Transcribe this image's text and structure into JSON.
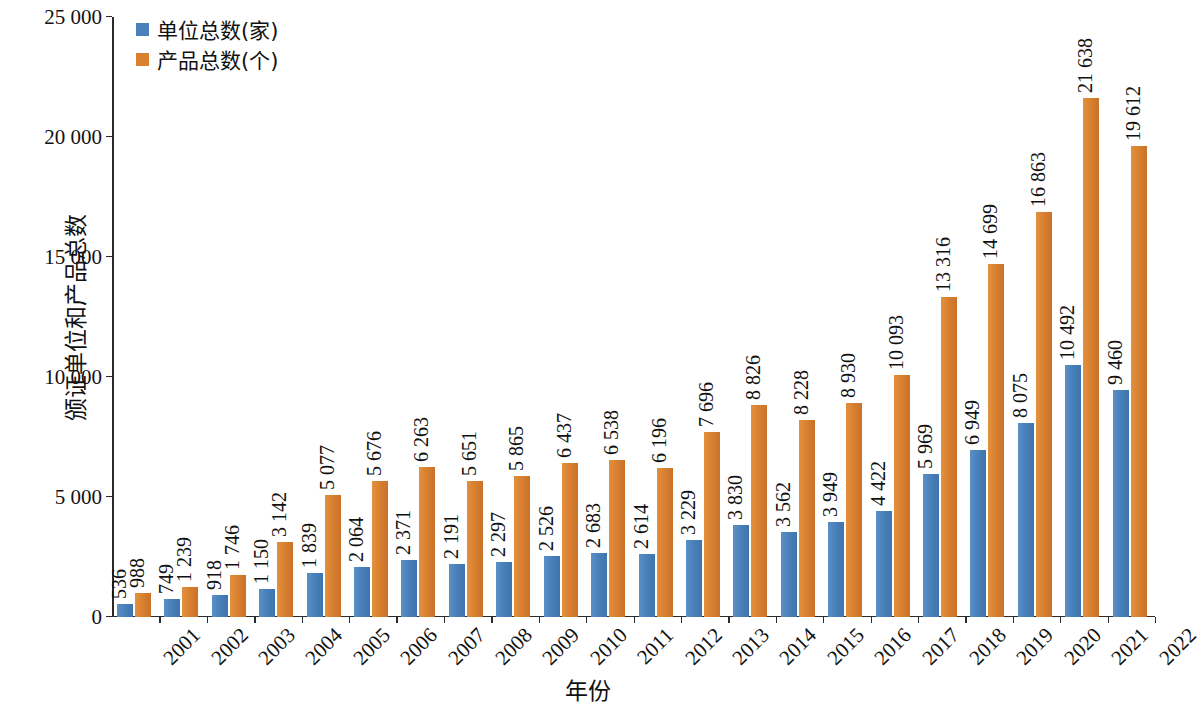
{
  "chart_data": {
    "type": "bar",
    "title": "",
    "xlabel": "年份",
    "ylabel": "颁证单位和产品总数",
    "ylim": [
      0,
      25000
    ],
    "ytick_labels": [
      "0",
      "5 000",
      "10 000",
      "15 000",
      "20 000",
      "25 000"
    ],
    "ytick_values": [
      0,
      5000,
      10000,
      15000,
      20000,
      25000
    ],
    "grid": false,
    "legend_position": "top-left",
    "categories": [
      "2001",
      "2002",
      "2003",
      "2004",
      "2005",
      "2006",
      "2007",
      "2008",
      "2009",
      "2010",
      "2011",
      "2012",
      "2013",
      "2014",
      "2015",
      "2016",
      "2017",
      "2018",
      "2019",
      "2020",
      "2021",
      "2022"
    ],
    "series": [
      {
        "name": "单位总数(家)",
        "color": "#4a81bb",
        "values": [
          536,
          749,
          918,
          1150,
          1839,
          2064,
          2371,
          2191,
          2297,
          2526,
          2683,
          2614,
          3229,
          3830,
          3562,
          3949,
          4422,
          5969,
          6949,
          8075,
          10492,
          9460
        ],
        "labels": [
          "536",
          "749",
          "918",
          "1 150",
          "1 839",
          "2 064",
          "2 371",
          "2 191",
          "2 297",
          "2 526",
          "2 683",
          "2 614",
          "3 229",
          "3 830",
          "3 562",
          "3 949",
          "4 422",
          "5 969",
          "6 949",
          "8 075",
          "10 492",
          "9 460"
        ]
      },
      {
        "name": "产品总数(个)",
        "color": "#d9812f",
        "values": [
          988,
          1239,
          1746,
          3142,
          5077,
          5676,
          6263,
          5651,
          5865,
          6437,
          6538,
          6196,
          7696,
          8826,
          8228,
          8930,
          10093,
          13316,
          14699,
          16863,
          21638,
          19612
        ],
        "labels": [
          "988",
          "1 239",
          "1 746",
          "3 142",
          "5 077",
          "5 676",
          "6 263",
          "5 651",
          "5 865",
          "6 437",
          "6 538",
          "6 196",
          "7 696",
          "8 826",
          "8 228",
          "8 930",
          "10 093",
          "13 316",
          "14 699",
          "16 863",
          "21 638",
          "19 612"
        ]
      }
    ]
  },
  "legend": {
    "items": [
      {
        "label": "单位总数(家)",
        "color": "#4a81bb"
      },
      {
        "label": "产品总数(个)",
        "color": "#d9812f"
      }
    ]
  },
  "axes": {
    "y_title": "颁证单位和产品总数",
    "x_title": "年份"
  }
}
